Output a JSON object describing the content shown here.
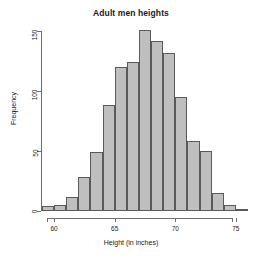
{
  "chart_data": {
    "type": "bar",
    "title": "Adult men heights",
    "xlabel": "Height (in inches)",
    "ylabel": "Frequency",
    "grid": false,
    "legend": null,
    "xlim": [
      59,
      76
    ],
    "ylim": [
      0,
      155
    ],
    "xticks": [
      60,
      65,
      70,
      75
    ],
    "yticks": [
      0,
      50,
      100,
      150
    ],
    "bin_width": 1,
    "bin_edges": [
      59,
      60,
      61,
      62,
      63,
      64,
      65,
      66,
      67,
      68,
      69,
      70,
      71,
      72,
      73,
      74,
      75,
      76
    ],
    "categories": [
      "59-60",
      "60-61",
      "61-62",
      "62-63",
      "63-64",
      "64-65",
      "66-67",
      "67-68",
      "68-69",
      "69-70",
      "70-71",
      "71-72",
      "72-73",
      "73-74",
      "74-75",
      "75-76",
      "65-66"
    ],
    "bins": [
      {
        "start": 59,
        "end": 60,
        "value": 4
      },
      {
        "start": 60,
        "end": 61,
        "value": 5
      },
      {
        "start": 61,
        "end": 62,
        "value": 12
      },
      {
        "start": 62,
        "end": 63,
        "value": 28
      },
      {
        "start": 63,
        "end": 64,
        "value": 49
      },
      {
        "start": 64,
        "end": 65,
        "value": 88
      },
      {
        "start": 65,
        "end": 66,
        "value": 120
      },
      {
        "start": 66,
        "end": 67,
        "value": 124
      },
      {
        "start": 67,
        "end": 68,
        "value": 151
      },
      {
        "start": 68,
        "end": 69,
        "value": 142
      },
      {
        "start": 69,
        "end": 70,
        "value": 132
      },
      {
        "start": 70,
        "end": 71,
        "value": 95
      },
      {
        "start": 71,
        "end": 72,
        "value": 58
      },
      {
        "start": 72,
        "end": 73,
        "value": 50
      },
      {
        "start": 73,
        "end": 74,
        "value": 15
      },
      {
        "start": 74,
        "end": 75,
        "value": 5
      },
      {
        "start": 75,
        "end": 76,
        "value": 2
      }
    ],
    "values": [
      4,
      5,
      12,
      28,
      49,
      88,
      120,
      124,
      151,
      142,
      132,
      95,
      58,
      50,
      15,
      5,
      2
    ],
    "colors": {
      "bar_fill": "#bfbfbf",
      "bar_border": "#5a5a5a",
      "axis": "#6e6e6e",
      "text": "#1a1a1a",
      "background": "#ffffff"
    }
  }
}
